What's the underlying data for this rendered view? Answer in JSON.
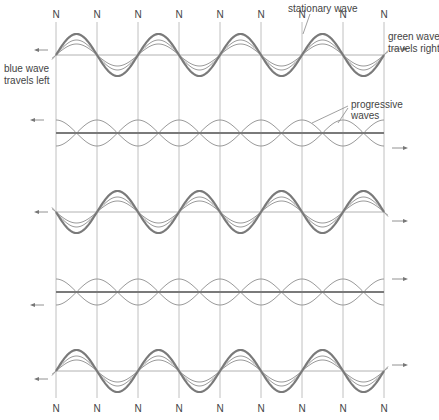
{
  "diagram": {
    "node_label": "N",
    "node_count": 9,
    "labels": {
      "stationary_wave": "stationary wave",
      "green_wave": [
        "green wave",
        "travels right"
      ],
      "blue_wave": [
        "blue wave",
        "travels left"
      ],
      "progressive_waves": [
        "progressive",
        "waves"
      ]
    },
    "colors": {
      "background": "#ffffff",
      "node_line": "#b0b0b0",
      "baseline": "#a0a0a0",
      "stationary_wave": "#7a7a7a",
      "progressive_wave": "#9a9a9a",
      "text": "#444444"
    },
    "rows": [
      {
        "type": "stationary",
        "phase": "up",
        "description": "stationary wave at maximum displacement"
      },
      {
        "type": "progressive",
        "description": "progressive waves cancel, resultant flat"
      },
      {
        "type": "stationary",
        "phase": "down",
        "description": "stationary wave inverted"
      },
      {
        "type": "progressive",
        "description": "progressive waves cancel, resultant flat"
      },
      {
        "type": "stationary",
        "phase": "up",
        "description": "stationary wave at maximum displacement"
      }
    ]
  }
}
